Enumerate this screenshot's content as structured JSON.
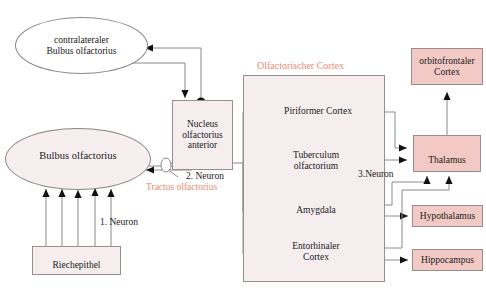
{
  "diagram": {
    "title_label": "Olfactorischer Cortex",
    "tract_label": "Tractus olfactorius",
    "neuron_labels": {
      "first": "1. Neuron",
      "second": "2. Neuron",
      "third": "3.Neuron"
    },
    "colors": {
      "pink_fill": "#f2c9c4",
      "faint_fill": "#f6eeee",
      "salmon_text": "#e88b72",
      "line": "#8a8a8a",
      "marker": "#111111",
      "box_border": "#9a8d8d"
    },
    "nodes": {
      "contralateral_bulb": "contralateraler\nBulbus olfactorius",
      "contralateral_bulb_line1": "contralateraler",
      "contralateral_bulb_line2": "Bulbus olfactorius",
      "bulbus": "Bulbus olfactorius",
      "riechepithel": "Riechepithel",
      "nucleus_line1": "Nucleus",
      "nucleus_line2": "olfactorius",
      "nucleus_line3": "anterior",
      "piriformer": "Piriformer Cortex",
      "tuberculum_line1": "Tuberculum",
      "tuberculum_line2": "olfactorium",
      "amygdala": "Amygdala",
      "entorhinaler_line1": "Entorhinaler",
      "entorhinaler_line2": "Cortex",
      "orbitofrontaler_line1": "orbitofrontaler",
      "orbitofrontaler_line2": "Cortex",
      "thalamus": "Thalamus",
      "hypothalamus": "Hypothalamus",
      "hippocampus": "Hippocampus"
    }
  }
}
